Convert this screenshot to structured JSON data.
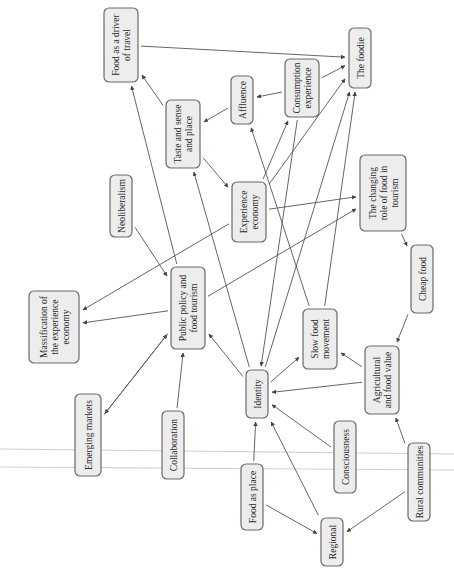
{
  "diagram": {
    "orientation": "rotated-90-ccw",
    "nodes": [
      {
        "id": "food_driver",
        "lines": [
          "Food as a driver",
          "of travel"
        ]
      },
      {
        "id": "foodie",
        "lines": [
          "The foodie"
        ]
      },
      {
        "id": "affluence",
        "lines": [
          "Affluence"
        ]
      },
      {
        "id": "consumption",
        "lines": [
          "Consumption",
          "experience"
        ]
      },
      {
        "id": "taste",
        "lines": [
          "Taste and sense",
          "and place"
        ]
      },
      {
        "id": "neoliberalism",
        "lines": [
          "Neoliberalism"
        ]
      },
      {
        "id": "experience",
        "lines": [
          "Experience",
          "economy"
        ]
      },
      {
        "id": "changing",
        "lines": [
          "The changing",
          "role of food in",
          "tourism"
        ]
      },
      {
        "id": "massification",
        "lines": [
          "Massification of",
          "the experience",
          "economy"
        ]
      },
      {
        "id": "public",
        "lines": [
          "Public policy and",
          "food tourism"
        ]
      },
      {
        "id": "slowfood",
        "lines": [
          "Slow food",
          "movement"
        ]
      },
      {
        "id": "cheapfood",
        "lines": [
          "Cheap food"
        ]
      },
      {
        "id": "emerging",
        "lines": [
          "Emerging markets"
        ]
      },
      {
        "id": "collaboration",
        "lines": [
          "Collaboration"
        ]
      },
      {
        "id": "identity",
        "lines": [
          "Identity"
        ]
      },
      {
        "id": "agricultural",
        "lines": [
          "Agricultural",
          "and food value"
        ]
      },
      {
        "id": "foodplace",
        "lines": [
          "Food as place"
        ]
      },
      {
        "id": "consciousness",
        "lines": [
          "Consciousness"
        ]
      },
      {
        "id": "rural",
        "lines": [
          "Rural communities"
        ]
      },
      {
        "id": "regional",
        "lines": [
          "Regional"
        ]
      }
    ],
    "edges": [
      {
        "from": "food_driver",
        "to": "foodie"
      },
      {
        "from": "taste",
        "to": "food_driver"
      },
      {
        "from": "public",
        "to": "food_driver"
      },
      {
        "from": "consumption",
        "to": "foodie"
      },
      {
        "from": "consumption",
        "to": "affluence"
      },
      {
        "from": "affluence",
        "to": "taste"
      },
      {
        "from": "experience",
        "to": "consumption"
      },
      {
        "from": "experience",
        "to": "foodie"
      },
      {
        "from": "taste",
        "to": "experience"
      },
      {
        "from": "identity",
        "to": "taste"
      },
      {
        "from": "slowfood",
        "to": "affluence"
      },
      {
        "from": "slowfood",
        "to": "foodie"
      },
      {
        "from": "identity",
        "to": "foodie"
      },
      {
        "from": "consumption",
        "to": "identity"
      },
      {
        "from": "experience",
        "to": "changing"
      },
      {
        "from": "experience",
        "to": "massification"
      },
      {
        "from": "public",
        "to": "changing"
      },
      {
        "from": "neoliberalism",
        "to": "public"
      },
      {
        "from": "public",
        "to": "massification"
      },
      {
        "from": "emerging",
        "to": "public"
      },
      {
        "from": "public",
        "to": "emerging"
      },
      {
        "from": "changing",
        "to": "cheapfood"
      },
      {
        "from": "cheapfood",
        "to": "agricultural"
      },
      {
        "from": "collaboration",
        "to": "public"
      },
      {
        "from": "identity",
        "to": "public"
      },
      {
        "from": "identity",
        "to": "slowfood"
      },
      {
        "from": "agricultural",
        "to": "slowfood"
      },
      {
        "from": "agricultural",
        "to": "identity"
      },
      {
        "from": "foodplace",
        "to": "identity"
      },
      {
        "from": "consciousness",
        "to": "identity"
      },
      {
        "from": "regional",
        "to": "identity"
      },
      {
        "from": "rural",
        "to": "agricultural"
      },
      {
        "from": "rural",
        "to": "regional"
      },
      {
        "from": "foodplace",
        "to": "regional"
      }
    ]
  }
}
